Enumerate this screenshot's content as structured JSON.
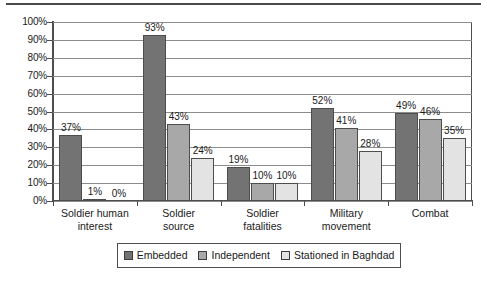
{
  "chart_data": {
    "type": "bar",
    "title": "",
    "xlabel": "",
    "ylabel": "",
    "ylim": [
      0,
      100
    ],
    "ytick_labels": [
      "100%",
      "90%",
      "80%",
      "70%",
      "60%",
      "50%",
      "40%",
      "30%",
      "20%",
      "10%",
      "0%"
    ],
    "ytick_values": [
      100,
      90,
      80,
      70,
      60,
      50,
      40,
      30,
      20,
      10,
      0
    ],
    "grid": true,
    "legend_position": "bottom",
    "categories": [
      "Soldier human\ninterest",
      "Soldier\nsource",
      "Soldier\nfatalities",
      "Military\nmovement",
      "Combat"
    ],
    "series": [
      {
        "name": "Embedded",
        "color": "#737373",
        "values": [
          37,
          93,
          19,
          52,
          49
        ],
        "labels": [
          "37%",
          "93%",
          "19%",
          "52%",
          "49%"
        ]
      },
      {
        "name": "Independent",
        "color": "#a8a8a8",
        "values": [
          1,
          43,
          10,
          41,
          46
        ],
        "labels": [
          "1%",
          "43%",
          "10%",
          "41%",
          "46%"
        ]
      },
      {
        "name": "Stationed in Baghdad",
        "color": "#e3e3e3",
        "values": [
          0,
          24,
          10,
          28,
          35
        ],
        "labels": [
          "0%",
          "24%",
          "10%",
          "28%",
          "35%"
        ]
      }
    ]
  },
  "legend": {
    "items": [
      {
        "label": "Embedded",
        "color": "#737373"
      },
      {
        "label": "Independent",
        "color": "#a8a8a8"
      },
      {
        "label": "Stationed in Baghdad",
        "color": "#e3e3e3"
      }
    ]
  }
}
